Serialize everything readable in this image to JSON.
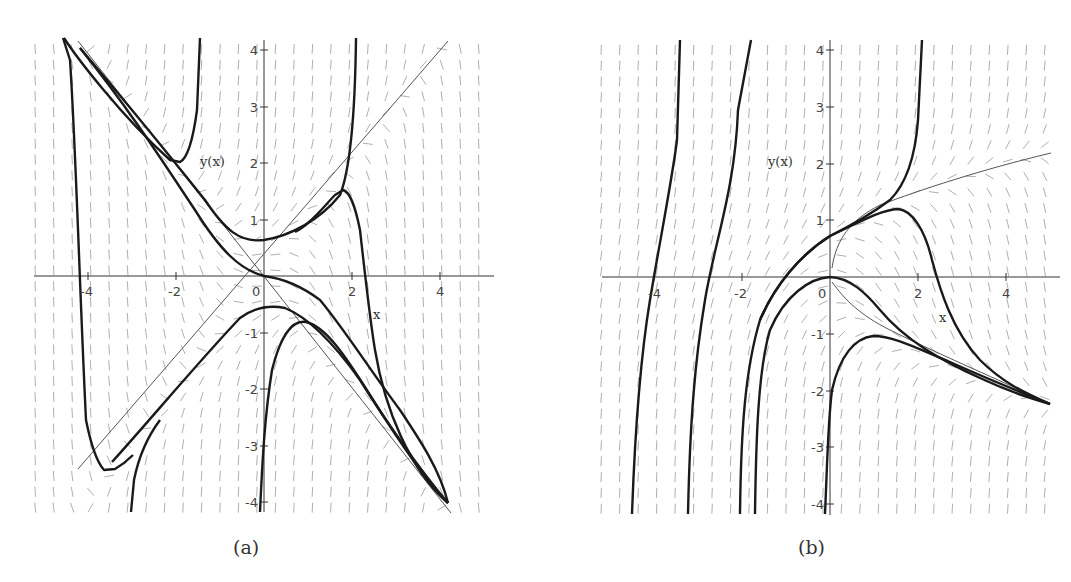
{
  "chart_data": [
    {
      "type": "line",
      "subtype": "direction_field_with_solution_curves",
      "caption": "(a)",
      "title": "",
      "xlabel": "x",
      "ylabel": "y(x)",
      "xlim": [
        -5,
        5
      ],
      "ylim": [
        -4.2,
        4.2
      ],
      "x_ticks": [
        -4,
        -2,
        0,
        2,
        4
      ],
      "y_ticks": [
        -4,
        -3,
        -2,
        -1,
        0,
        1,
        2,
        3,
        4
      ],
      "x_tick_labels": [
        "-4",
        "-2",
        "0",
        "2",
        "4"
      ],
      "y_tick_labels": [
        "-4",
        "-3",
        "-2",
        "-1",
        "1",
        "2",
        "3",
        "4"
      ],
      "grid": false,
      "legend": null,
      "reference_lines": [
        {
          "name": "y = x",
          "points": [
            [
              -3.5,
              -3.5
            ],
            [
              4.2,
              4.2
            ]
          ]
        },
        {
          "name": "y = -x",
          "points": [
            [
              -4.2,
              4.2
            ],
            [
              4.2,
              -4.2
            ]
          ]
        }
      ],
      "series": [
        {
          "name": "curve-upper-left-cusp",
          "points": [
            [
              -4.1,
              4.2
            ],
            [
              -3.5,
              3.4
            ],
            [
              -2.8,
              2.6
            ],
            [
              -2.1,
              2.0
            ],
            [
              -1.9,
              2.0
            ],
            [
              -1.75,
              2.3
            ],
            [
              -1.65,
              3.0
            ],
            [
              -1.6,
              4.2
            ]
          ]
        },
        {
          "name": "curve-valley",
          "points": [
            [
              -4.2,
              4.0
            ],
            [
              -3.5,
              3.2
            ],
            [
              -2.5,
              2.1
            ],
            [
              -1.7,
              1.2
            ],
            [
              -1.0,
              0.65
            ],
            [
              -0.5,
              0.55
            ],
            [
              0.0,
              0.65
            ],
            [
              0.7,
              0.95
            ],
            [
              1.3,
              1.35
            ],
            [
              1.7,
              1.9
            ],
            [
              2.0,
              3.0
            ],
            [
              2.1,
              4.2
            ]
          ]
        },
        {
          "name": "curve-through-origin",
          "points": [
            [
              -4.2,
              4.0
            ],
            [
              -3.0,
              2.8
            ],
            [
              -2.0,
              1.4
            ],
            [
              -1.2,
              0.4
            ],
            [
              -0.5,
              0.05
            ],
            [
              0.0,
              0.0
            ],
            [
              0.5,
              -0.05
            ],
            [
              1.0,
              -0.3
            ],
            [
              1.6,
              -1.0
            ],
            [
              2.2,
              -1.8
            ],
            [
              3.0,
              -2.8
            ],
            [
              4.2,
              -4.0
            ]
          ]
        },
        {
          "name": "curve-hump",
          "points": [
            [
              -3.5,
              -3.4
            ],
            [
              -2.5,
              -2.3
            ],
            [
              -1.5,
              -1.3
            ],
            [
              -0.5,
              -0.65
            ],
            [
              0.3,
              -0.45
            ],
            [
              1.0,
              -0.7
            ],
            [
              1.8,
              -1.4
            ],
            [
              2.5,
              -2.2
            ],
            [
              3.2,
              -3.0
            ],
            [
              4.2,
              -4.0
            ]
          ]
        },
        {
          "name": "curve-lower-cusp",
          "points": [
            [
              -0.1,
              -4.1
            ],
            [
              0.0,
              -2.5
            ],
            [
              0.2,
              -1.5
            ],
            [
              0.5,
              -1.05
            ],
            [
              0.9,
              -0.9
            ],
            [
              1.3,
              -1.1
            ],
            [
              2.0,
              -1.8
            ],
            [
              2.8,
              -2.6
            ],
            [
              3.5,
              -3.3
            ],
            [
              4.2,
              -4.0
            ]
          ]
        },
        {
          "name": "curve-left-drop",
          "points": [
            [
              -4.3,
              4.2
            ],
            [
              -4.2,
              3.3
            ],
            [
              -4.1,
              1.0
            ],
            [
              -4.0,
              -2.0
            ],
            [
              -3.9,
              -2.8
            ],
            [
              -3.7,
              -3.4
            ],
            [
              -3.5,
              -3.4
            ],
            [
              -3.3,
              -3.2
            ]
          ]
        },
        {
          "name": "curve-right-hump",
          "points": [
            [
              0.7,
              0.95
            ],
            [
              1.2,
              1.35
            ],
            [
              1.6,
              1.5
            ],
            [
              1.8,
              1.4
            ],
            [
              2.0,
              0.6
            ],
            [
              2.2,
              -0.5
            ],
            [
              2.5,
              -1.5
            ],
            [
              3.0,
              -2.8
            ],
            [
              4.2,
              -4.0
            ]
          ]
        },
        {
          "name": "curve-bottom-left-rise",
          "points": [
            [
              -2.8,
              -4.2
            ],
            [
              -2.7,
              -3.6
            ],
            [
              -2.5,
              -3.0
            ],
            [
              -2.0,
              -2.2
            ]
          ]
        }
      ]
    },
    {
      "type": "line",
      "subtype": "direction_field_with_solution_curves",
      "caption": "(b)",
      "title": "",
      "xlabel": "x",
      "ylabel": "y(x)",
      "xlim": [
        -5,
        5
      ],
      "ylim": [
        -4.2,
        4.2
      ],
      "x_ticks": [
        -4,
        -2,
        0,
        2,
        4
      ],
      "y_ticks": [
        -4,
        -3,
        -2,
        -1,
        0,
        1,
        2,
        3,
        4
      ],
      "x_tick_labels": [
        "-4",
        "-2",
        "0",
        "2",
        "4"
      ],
      "y_tick_labels": [
        "-4",
        "-3",
        "-2",
        "-1",
        "1",
        "2",
        "3",
        "4"
      ],
      "grid": false,
      "legend": null,
      "reference_lines": [
        {
          "name": "upper-isocline",
          "points": [
            [
              0.0,
              0.2
            ],
            [
              0.5,
              0.9
            ],
            [
              1.5,
              1.3
            ],
            [
              3.0,
              1.8
            ],
            [
              5.0,
              2.2
            ]
          ]
        },
        {
          "name": "lower-isocline",
          "points": [
            [
              0.0,
              0.0
            ],
            [
              0.5,
              -0.6
            ],
            [
              1.5,
              -1.1
            ],
            [
              3.0,
              -1.6
            ],
            [
              5.0,
              -2.3
            ]
          ]
        }
      ],
      "series": [
        {
          "name": "curve-far-left",
          "points": [
            [
              -4.5,
              -4.2
            ],
            [
              -4.3,
              -2.0
            ],
            [
              -4.0,
              0.0
            ],
            [
              -3.7,
              2.5
            ],
            [
              -3.6,
              4.2
            ]
          ]
        },
        {
          "name": "curve-left",
          "points": [
            [
              -3.3,
              -4.2
            ],
            [
              -3.2,
              -2.0
            ],
            [
              -2.6,
              0.0
            ],
            [
              -2.2,
              2.0
            ],
            [
              -2.0,
              4.2
            ]
          ]
        },
        {
          "name": "curve-center-rise",
          "points": [
            [
              -2.1,
              -4.2
            ],
            [
              -2.0,
              -2.2
            ],
            [
              -1.7,
              -1.0
            ],
            [
              -1.2,
              0.0
            ],
            [
              -0.5,
              0.55
            ],
            [
              0.0,
              0.75
            ],
            [
              0.8,
              1.05
            ],
            [
              1.4,
              1.4
            ],
            [
              1.8,
              2.0
            ],
            [
              2.0,
              3.0
            ],
            [
              2.1,
              4.2
            ]
          ]
        },
        {
          "name": "curve-center-hump",
          "points": [
            [
              -0.5,
              0.55
            ],
            [
              0.0,
              0.75
            ],
            [
              0.8,
              1.1
            ],
            [
              1.5,
              1.2
            ],
            [
              2.0,
              0.8
            ],
            [
              2.5,
              0.0
            ],
            [
              2.8,
              -0.8
            ],
            [
              3.3,
              -1.5
            ],
            [
              4.0,
              -1.9
            ],
            [
              5.0,
              -2.2
            ]
          ]
        },
        {
          "name": "curve-origin-cap",
          "points": [
            [
              -1.7,
              -4.2
            ],
            [
              -1.7,
              -2.0
            ],
            [
              -1.3,
              -0.8
            ],
            [
              -0.7,
              -0.2
            ],
            [
              0.0,
              0.0
            ],
            [
              0.6,
              -0.2
            ],
            [
              1.3,
              -0.7
            ],
            [
              2.2,
              -1.3
            ],
            [
              3.3,
              -1.8
            ],
            [
              5.0,
              -2.2
            ]
          ]
        },
        {
          "name": "curve-lower-cusp",
          "points": [
            [
              -0.1,
              -4.2
            ],
            [
              0.0,
              -2.5
            ],
            [
              0.3,
              -1.5
            ],
            [
              0.6,
              -1.1
            ],
            [
              1.0,
              -1.0
            ],
            [
              1.6,
              -1.15
            ],
            [
              2.5,
              -1.5
            ],
            [
              3.5,
              -1.9
            ],
            [
              5.0,
              -2.2
            ]
          ]
        }
      ]
    }
  ],
  "panels": {
    "a": {
      "caption": "(a)",
      "xlabel": "x",
      "ylabel": "y(x)",
      "xtick": {
        "m4": "-4",
        "m2": "-2",
        "z": "0",
        "p2": "2",
        "p4": "4"
      },
      "ytick": {
        "p4": "4",
        "p3": "3",
        "p2": "2",
        "p1": "1",
        "m1": "-1",
        "m2": "-2",
        "m3": "-3",
        "m4": "-4"
      }
    },
    "b": {
      "caption": "(b)",
      "xlabel": "x",
      "ylabel": "y(x)",
      "xtick": {
        "m4": "-4",
        "m2": "-2",
        "z": "0",
        "p2": "2",
        "p4": "4"
      },
      "ytick": {
        "p4": "4",
        "p3": "3",
        "p2": "2",
        "p1": "1",
        "m1": "-1",
        "m2": "-2",
        "m3": "-3",
        "m4": "-4"
      }
    }
  },
  "colors": {
    "solution_curve": "#1a1a1a",
    "reference_line": "#555555",
    "field_arrow": "#9a9a9a",
    "axis": "#333333"
  }
}
